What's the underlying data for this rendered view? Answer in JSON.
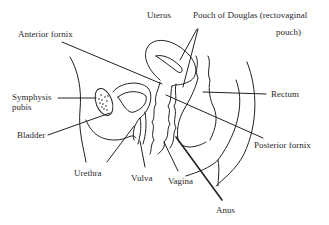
{
  "diagram": {
    "type": "anatomical-sagittal-section",
    "line_color": "#222222",
    "background": "#ffffff",
    "labels": {
      "uterus": "Uterus",
      "pouch_line1": "Pouch of Douglas (rectovaginal",
      "pouch_line2": "pouch)",
      "anterior_fornix": "Anterior fornix",
      "symphysis_line1": "Symphysis",
      "symphysis_line2": "pubis",
      "rectum": "Rectum",
      "bladder": "Bladder",
      "posterior_fornix": "Posterior fornix",
      "urethra": "Urethra",
      "vulva": "Vulva",
      "vagina": "Vagina",
      "anus": "Anus"
    }
  }
}
